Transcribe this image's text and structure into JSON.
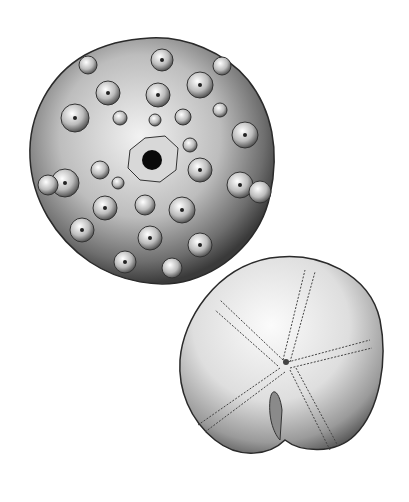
{
  "illustration": {
    "kind": "natural-history engraving",
    "background": "#ffffff",
    "ink": "#1a1a1a",
    "specimens": [
      {
        "name": "regular-echinoid-test",
        "view": "aboral (top) view",
        "position": "upper-left",
        "features": [
          "large primary tubercles with areoles",
          "central apical disc with periproct (black opening)",
          "granular interambulacral surface"
        ]
      },
      {
        "name": "heart-urchin-test",
        "view": "aboral (top) view",
        "position": "lower-right",
        "features": [
          "five petaloid ambulacra radiating from apex",
          "anterior notch/groove",
          "stippled shading"
        ]
      }
    ]
  }
}
